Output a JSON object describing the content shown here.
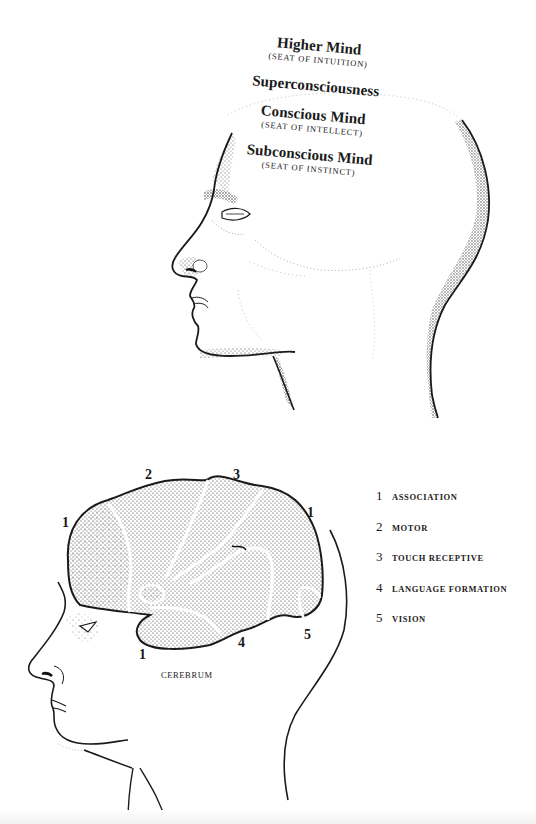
{
  "figure_top": {
    "type": "head-profile-illustration",
    "labels": [
      {
        "title": "Higher Mind",
        "subtitle": "(seat of intuition)"
      },
      {
        "title": "Superconsciousness",
        "subtitle": ""
      },
      {
        "title": "Conscious Mind",
        "subtitle": "(seat of intellect)"
      },
      {
        "title": "Subconscious Mind",
        "subtitle": "(seat of instinct)"
      }
    ]
  },
  "figure_bottom": {
    "type": "brain-lobe-diagram",
    "caption": "Cerebrum",
    "region_markers": [
      {
        "num": "1",
        "pos": "front"
      },
      {
        "num": "2",
        "pos": "top-front"
      },
      {
        "num": "3",
        "pos": "top-back"
      },
      {
        "num": "1",
        "pos": "back-top"
      },
      {
        "num": "1",
        "pos": "bottom-front"
      },
      {
        "num": "4",
        "pos": "bottom-middle"
      },
      {
        "num": "5",
        "pos": "back-bottom"
      }
    ],
    "legend": [
      {
        "num": "1",
        "label": "Association"
      },
      {
        "num": "2",
        "label": "Motor"
      },
      {
        "num": "3",
        "label": "Touch Receptive"
      },
      {
        "num": "4",
        "label": "Language Formation"
      },
      {
        "num": "5",
        "label": "Vision"
      }
    ]
  },
  "colors": {
    "ink": "#1a1a1a",
    "paper": "#ffffff"
  }
}
